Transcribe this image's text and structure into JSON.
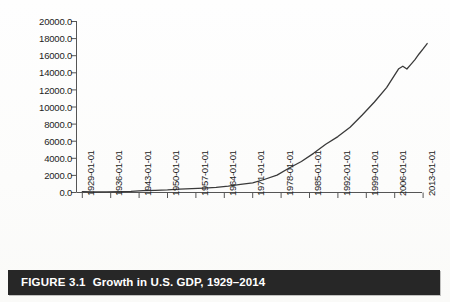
{
  "figure": {
    "caption_label": "FIGURE 3.1",
    "caption_title": "Growth in U.S. GDP, 1929–2014",
    "caption_bar_color": "#272727",
    "caption_text_color": "#ffffff"
  },
  "chart_data": {
    "type": "line",
    "title": "",
    "xlabel": "",
    "ylabel": "",
    "grid": false,
    "legend": "none",
    "line_color": "#3a3a3a",
    "axis_color": "#555555",
    "ylim": [
      0,
      20000
    ],
    "ytick_labels": [
      "20000.0",
      "18000.0",
      "16000.0",
      "14000.0",
      "12000.0",
      "10000.0",
      "8000.0",
      "6000.0",
      "4000.0",
      "2000.0",
      "0.0"
    ],
    "ytick_values": [
      20000,
      18000,
      16000,
      14000,
      12000,
      10000,
      8000,
      6000,
      4000,
      2000,
      0
    ],
    "xtick_labels": [
      "1929-01-01",
      "1936-01-01",
      "1943-01-01",
      "1950-01-01",
      "1957-01-01",
      "1964-01-01",
      "1971-01-01",
      "1978-01-01",
      "1985-01-01",
      "1992-01-01",
      "1999-01-01",
      "2006-01-01",
      "2013-01-01"
    ],
    "xtick_values": [
      1929,
      1936,
      1943,
      1950,
      1957,
      1964,
      1971,
      1978,
      1985,
      1992,
      1999,
      2006,
      2013
    ],
    "xlim": [
      1929,
      2014
    ],
    "x": [
      1929,
      1932,
      1935,
      1938,
      1941,
      1944,
      1947,
      1950,
      1953,
      1956,
      1959,
      1962,
      1965,
      1968,
      1971,
      1974,
      1977,
      1980,
      1983,
      1986,
      1989,
      1992,
      1995,
      1998,
      2001,
      2004,
      2007,
      2008,
      2009,
      2010,
      2011,
      2012,
      2013,
      2014
    ],
    "values": [
      105,
      60,
      74,
      87,
      129,
      224,
      250,
      300,
      390,
      450,
      522,
      605,
      744,
      940,
      1130,
      1550,
      2030,
      2860,
      3630,
      4580,
      5640,
      6540,
      7640,
      9060,
      10580,
      12270,
      14480,
      14770,
      14450,
      14990,
      15540,
      16200,
      16790,
      17420
    ],
    "units": "Billions of dollars (nominal GDP)"
  }
}
